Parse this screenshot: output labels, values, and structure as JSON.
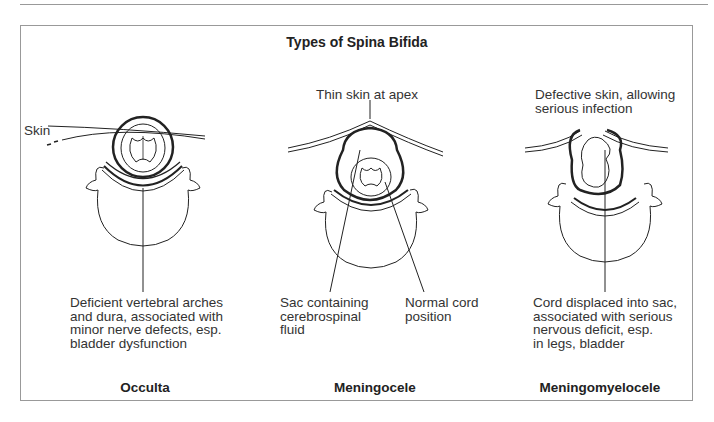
{
  "title": "Types of Spina Bifida",
  "panels": [
    {
      "name": "Occulta",
      "labels": {
        "skin": "Skin",
        "desc": "Deficient vertebral arches\nand dura, associated with\nminor nerve defects, esp.\nbladder dysfunction"
      }
    },
    {
      "name": "Meningocele",
      "labels": {
        "top": "Thin skin at apex",
        "sac": "Sac containing\ncerebrospinal\nfluid",
        "cord": "Normal cord\nposition"
      }
    },
    {
      "name": "Meningomyelocele",
      "labels": {
        "top": "Defective skin, allowing\nserious infection",
        "desc": "Cord displaced into sac,\nassociated with serious\nnervous deficit, esp.\nin legs, bladder"
      }
    }
  ]
}
